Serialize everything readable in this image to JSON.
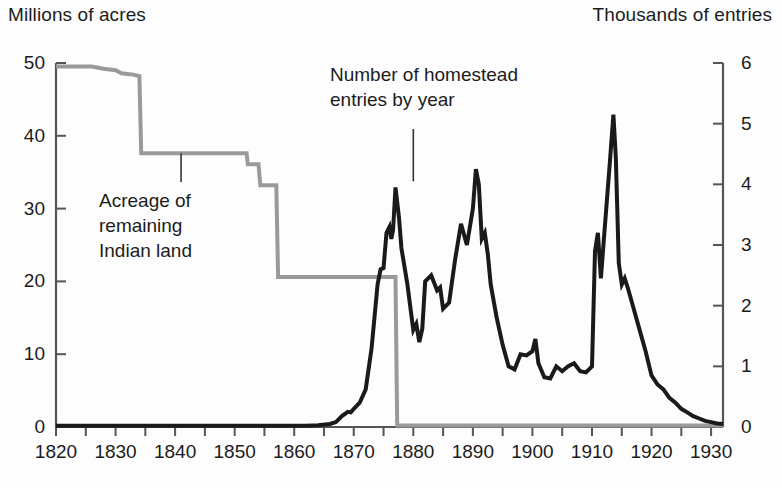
{
  "header": {
    "left_axis_title": "Millions of acres",
    "right_axis_title": "Thousands of entries"
  },
  "annotations": {
    "indian_land": "Acreage of\nremaining\nIndian land",
    "homestead": "Number of homestead\nentries by year"
  },
  "colors": {
    "indian_land_line": "#9a9a9a",
    "homestead_line": "#1a1a1a",
    "axis": "#555555",
    "text": "#1c1c1c",
    "background": "#fdfdfd"
  },
  "chart_data": {
    "type": "line",
    "title": "",
    "subtitle": "",
    "xlabel": "",
    "ylabel": "Millions of acres",
    "y2label": "Thousands of entries",
    "grid": false,
    "legend_position": "inline-annotations",
    "xlim": [
      1820,
      1932
    ],
    "ylim": [
      0,
      50
    ],
    "y2lim": [
      0,
      6
    ],
    "xticks": [
      1820,
      1830,
      1840,
      1850,
      1860,
      1870,
      1880,
      1890,
      1900,
      1910,
      1920,
      1930
    ],
    "xticks_minor_step": 5,
    "yticks_left": [
      0,
      10,
      20,
      30,
      40,
      50
    ],
    "yticks_right": [
      0,
      1,
      2,
      3,
      4,
      5,
      6
    ],
    "xtick_labels": [
      "1820",
      "1830",
      "1840",
      "1850",
      "1860",
      "1870",
      "1880",
      "1890",
      "1900",
      "1910",
      "1920",
      "1930"
    ],
    "ytick_labels_left": [
      "0",
      "10",
      "20",
      "30",
      "40",
      "50"
    ],
    "ytick_labels_right": [
      "0",
      "1",
      "2",
      "3",
      "4",
      "5",
      "6"
    ],
    "series": [
      {
        "name": "Acreage of remaining Indian land",
        "axis": "left",
        "units": "millions of acres",
        "color": "#9a9a9a",
        "width": 4,
        "style": "step",
        "points": [
          [
            1820,
            49.5
          ],
          [
            1826,
            49.5
          ],
          [
            1828,
            49.2
          ],
          [
            1830,
            49.0
          ],
          [
            1831,
            48.6
          ],
          [
            1832,
            48.5
          ],
          [
            1833,
            48.4
          ],
          [
            1834,
            48.2
          ],
          [
            1834.3,
            37.6
          ],
          [
            1852,
            37.6
          ],
          [
            1852.2,
            36.1
          ],
          [
            1854,
            36.1
          ],
          [
            1854.3,
            33.2
          ],
          [
            1857,
            33.2
          ],
          [
            1857.3,
            20.6
          ],
          [
            1877,
            20.6
          ],
          [
            1877.3,
            0.2
          ],
          [
            1932,
            0.2
          ]
        ]
      },
      {
        "name": "Number of homestead entries by year",
        "axis": "right",
        "units": "thousands of entries",
        "color": "#1a1a1a",
        "width": 4,
        "style": "line",
        "points": [
          [
            1820,
            0.02
          ],
          [
            1862,
            0.02
          ],
          [
            1864,
            0.03
          ],
          [
            1866,
            0.05
          ],
          [
            1867,
            0.08
          ],
          [
            1868,
            0.18
          ],
          [
            1869,
            0.25
          ],
          [
            1869.5,
            0.24
          ],
          [
            1870,
            0.3
          ],
          [
            1871,
            0.4
          ],
          [
            1872,
            0.62
          ],
          [
            1873,
            1.3
          ],
          [
            1874,
            2.35
          ],
          [
            1874.5,
            2.6
          ],
          [
            1875,
            2.62
          ],
          [
            1875.5,
            3.2
          ],
          [
            1876,
            3.3
          ],
          [
            1876.3,
            3.1
          ],
          [
            1876.6,
            3.25
          ],
          [
            1877,
            3.95
          ],
          [
            1877.6,
            3.45
          ],
          [
            1878,
            2.95
          ],
          [
            1879,
            2.35
          ],
          [
            1880,
            1.6
          ],
          [
            1880.5,
            1.7
          ],
          [
            1881,
            1.4
          ],
          [
            1881.5,
            1.62
          ],
          [
            1882,
            2.4
          ],
          [
            1883,
            2.5
          ],
          [
            1884,
            2.25
          ],
          [
            1884.5,
            2.3
          ],
          [
            1885,
            1.95
          ],
          [
            1886,
            2.05
          ],
          [
            1887,
            2.75
          ],
          [
            1888,
            3.35
          ],
          [
            1889,
            3.0
          ],
          [
            1890,
            3.6
          ],
          [
            1890.5,
            4.25
          ],
          [
            1891,
            4.0
          ],
          [
            1891.5,
            3.1
          ],
          [
            1892,
            3.2
          ],
          [
            1892.5,
            2.85
          ],
          [
            1893,
            2.35
          ],
          [
            1894,
            1.8
          ],
          [
            1895,
            1.35
          ],
          [
            1896,
            1.0
          ],
          [
            1897,
            0.95
          ],
          [
            1898,
            1.2
          ],
          [
            1899,
            1.18
          ],
          [
            1900,
            1.25
          ],
          [
            1900.5,
            1.45
          ],
          [
            1901,
            1.05
          ],
          [
            1902,
            0.82
          ],
          [
            1903,
            0.8
          ],
          [
            1904,
            1.0
          ],
          [
            1905,
            0.92
          ],
          [
            1906,
            1.0
          ],
          [
            1907,
            1.05
          ],
          [
            1908,
            0.92
          ],
          [
            1909,
            0.9
          ],
          [
            1910,
            1.0
          ],
          [
            1910.5,
            2.9
          ],
          [
            1911,
            3.2
          ],
          [
            1911.5,
            2.45
          ],
          [
            1912,
            3.1
          ],
          [
            1913,
            4.35
          ],
          [
            1913.6,
            5.15
          ],
          [
            1914,
            4.45
          ],
          [
            1914.5,
            2.7
          ],
          [
            1915,
            2.35
          ],
          [
            1915.5,
            2.45
          ],
          [
            1916,
            2.3
          ],
          [
            1917,
            1.95
          ],
          [
            1918,
            1.6
          ],
          [
            1919,
            1.25
          ],
          [
            1920,
            0.85
          ],
          [
            1921,
            0.7
          ],
          [
            1922,
            0.62
          ],
          [
            1923,
            0.48
          ],
          [
            1924,
            0.4
          ],
          [
            1925,
            0.3
          ],
          [
            1926,
            0.24
          ],
          [
            1927,
            0.18
          ],
          [
            1928,
            0.14
          ],
          [
            1929,
            0.1
          ],
          [
            1930,
            0.08
          ],
          [
            1931,
            0.06
          ],
          [
            1932,
            0.05
          ]
        ]
      }
    ],
    "annotations": [
      {
        "text": "Acreage of remaining Indian land",
        "target_x": 1841,
        "target_y_left": 37.6,
        "leader": true
      },
      {
        "text": "Number of homestead entries by year",
        "target_x": 1880,
        "target_y_right": 3.9,
        "leader": true
      }
    ]
  }
}
